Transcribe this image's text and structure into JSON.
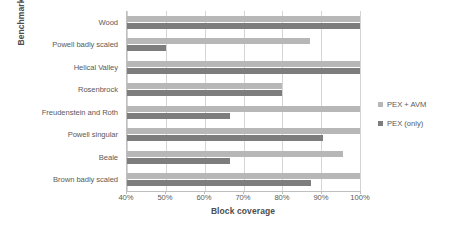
{
  "chart_data": {
    "type": "bar",
    "orientation": "horizontal",
    "title": "",
    "xlabel": "Block coverage",
    "ylabel": "Benchmark",
    "xlim": [
      40,
      100
    ],
    "xticks": [
      40,
      50,
      60,
      70,
      80,
      90,
      100
    ],
    "xtick_labels": [
      "40%",
      "50%",
      "60%",
      "70%",
      "80%",
      "90%",
      "100%"
    ],
    "grid": true,
    "grid_axis": "x",
    "legend_position": "right",
    "categories": [
      "Wood",
      "Powell badly scaled",
      "Helical Valley",
      "Rosenbrock",
      "Freudenstein and Roth",
      "Powell singular",
      "Beale",
      "Brown badly scaled"
    ],
    "series": [
      {
        "name": "PEX + AVM",
        "color": "#b7b7b7",
        "values": [
          100,
          87,
          100,
          80,
          100,
          100,
          95.5,
          100
        ]
      },
      {
        "name": "PEX (only)",
        "color": "#7d7d7d",
        "values": [
          100,
          50,
          100,
          80,
          66.5,
          90.5,
          66.5,
          87.5
        ]
      }
    ]
  },
  "legend": {
    "items": [
      {
        "label": "PEX + AVM",
        "color": "#b7b7b7"
      },
      {
        "label": "PEX (only)",
        "color": "#7d7d7d"
      }
    ]
  }
}
